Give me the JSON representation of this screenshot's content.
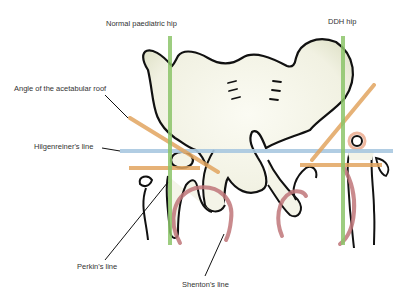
{
  "diagram": {
    "headings": {
      "normal": "Normal paediatric hip",
      "ddh": "DDH hip"
    },
    "labels": {
      "acetabular_angle": "Angle of the acetabular roof",
      "hilgenreiner": "Hilgenreiner's line",
      "perkin": "Perkin's line",
      "shenton": "Shenton's line"
    },
    "colors": {
      "hilgenreiner_line": "#a9c8e0",
      "perkin_line": "#8cc56a",
      "acetabular_roof_line": "#e2a560",
      "shenton_line": "#c0767a",
      "ossific_nucleus_halo": "#e8a080",
      "bone_fill": "#f4f4e8",
      "outline": "#111111"
    }
  }
}
